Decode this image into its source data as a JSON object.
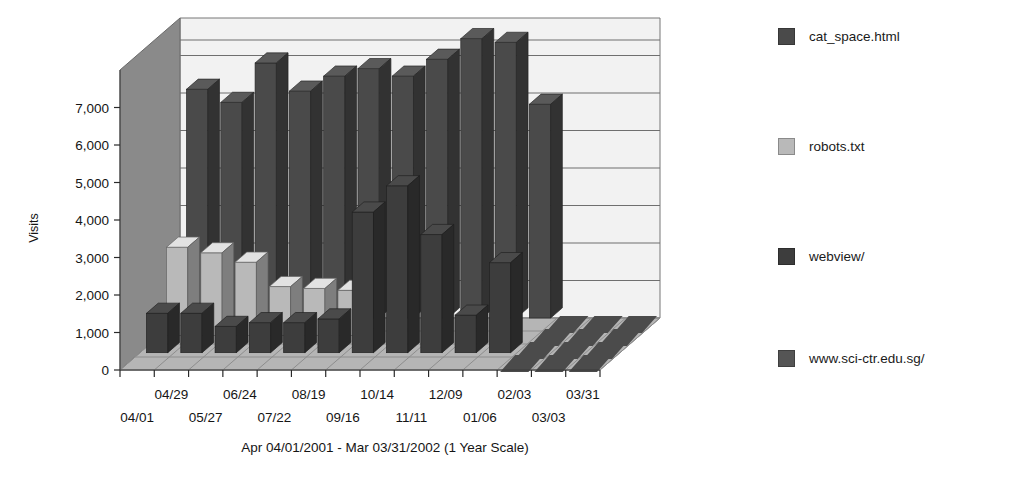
{
  "chart_data": {
    "type": "bar",
    "title": "Top Entry Pages",
    "xlabel": "Apr 04/01/2001 - Mar 03/31/2002 (1 Year Scale)",
    "ylabel": "Visits",
    "ylim": [
      0,
      8000
    ],
    "yticks": [
      0,
      1000,
      2000,
      3000,
      4000,
      5000,
      6000,
      7000
    ],
    "ytick_labels": [
      "0",
      "1,000",
      "2,000",
      "3,000",
      "4,000",
      "5,000",
      "6,000",
      "7,000"
    ],
    "grid": true,
    "legend_position": "right",
    "projection": "3d-rows",
    "categories": [
      "04/01",
      "04/29",
      "05/27",
      "06/24",
      "07/22",
      "08/19",
      "09/16",
      "10/14",
      "11/11",
      "12/09",
      "01/06",
      "02/03",
      "03/03",
      "03/31"
    ],
    "xtick_labels_row_top": [
      "04/29",
      "06/24",
      "08/19",
      "10/14",
      "12/09",
      "02/03",
      "03/31"
    ],
    "xtick_labels_row_bottom": [
      "04/01",
      "05/27",
      "07/22",
      "09/16",
      "11/11",
      "01/06",
      "03/03"
    ],
    "series": [
      {
        "name": "cat_space.html",
        "color": "#4a4a4a",
        "values": [
          6100,
          5750,
          6800,
          6050,
          6450,
          6650,
          6450,
          6900,
          7450,
          7350,
          5700,
          0,
          0,
          0
        ]
      },
      {
        "name": "robots.txt",
        "color": "#b9b9b9",
        "values": [
          2350,
          2200,
          1950,
          1300,
          1250,
          1200,
          0,
          0,
          0,
          0,
          0,
          0,
          0,
          0
        ]
      },
      {
        "name": "webview/",
        "color": "#3d3d3d",
        "values": [
          1050,
          1050,
          700,
          800,
          800,
          900,
          3750,
          4450,
          3150,
          1000,
          2400,
          0,
          0,
          0
        ]
      },
      {
        "name": "www.sci-ctr.edu.sg/",
        "color": "#555555",
        "values": [
          0,
          0,
          0,
          0,
          0,
          0,
          0,
          0,
          0,
          0,
          0,
          0,
          0,
          0
        ]
      }
    ]
  },
  "legend": {
    "items": [
      {
        "label": "cat_space.html",
        "color": "#4a4a4a",
        "top": 28
      },
      {
        "label": "robots.txt",
        "color": "#b9b9b9",
        "top": 138
      },
      {
        "label": "webview/",
        "color": "#3d3d3d",
        "top": 248
      },
      {
        "label": "www.sci-ctr.edu.sg/",
        "color": "#555555",
        "top": 350
      }
    ]
  },
  "palette": {
    "plot_background": "#f2f2f2",
    "wall_side": "#8a8a8a",
    "floor": "#b5b5b5",
    "grid_line": "#6f6f6f",
    "text": "#1a1a1a"
  }
}
